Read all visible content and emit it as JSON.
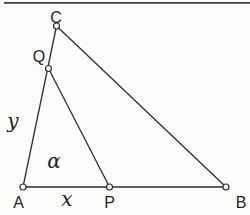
{
  "figure": {
    "type": "geometry-diagram",
    "background": "#fcfcfa",
    "stroke_color": "#2e2e2e",
    "marker_fill": "#fdfdfd",
    "top_rule": {
      "color": "#3c3c3c",
      "y": 2.8,
      "x1": 4,
      "x2": 250,
      "width": 1.8
    },
    "points": [
      {
        "id": "A",
        "x": 23,
        "y": 187,
        "label": "A",
        "lx": 18.5,
        "ly": 208
      },
      {
        "id": "P",
        "x": 109.5,
        "y": 187,
        "label": "P",
        "lx": 109.5,
        "ly": 208
      },
      {
        "id": "B",
        "x": 226,
        "y": 187,
        "label": "B",
        "lx": 241,
        "ly": 208
      },
      {
        "id": "C",
        "x": 56.5,
        "y": 26,
        "label": "C",
        "lx": 56,
        "ly": 23
      },
      {
        "id": "Q",
        "x": 48.5,
        "y": 68.5,
        "label": "Q",
        "lx": 39,
        "ly": 62
      }
    ],
    "segments": [
      {
        "from": "A",
        "to": "C"
      },
      {
        "from": "C",
        "to": "B"
      },
      {
        "from": "A",
        "to": "B"
      },
      {
        "from": "Q",
        "to": "P"
      }
    ],
    "math_labels": [
      {
        "id": "side-y",
        "text": "y",
        "x": 13,
        "y": 128
      },
      {
        "id": "side-x",
        "text": "x",
        "x": 67,
        "y": 206
      },
      {
        "id": "angle-alpha",
        "text": "α",
        "x": 54,
        "y": 168
      }
    ]
  }
}
